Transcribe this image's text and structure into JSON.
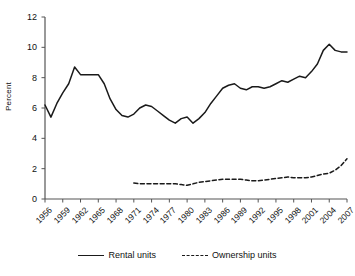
{
  "chart_data": {
    "type": "line",
    "title": "",
    "xlabel": "",
    "ylabel": "Percent",
    "ylim": [
      0,
      12
    ],
    "yticks": [
      0,
      2,
      4,
      6,
      8,
      10,
      12
    ],
    "xlim": [
      1956,
      2007
    ],
    "xticks": [
      1956,
      1959,
      1962,
      1965,
      1968,
      1971,
      1974,
      1977,
      1980,
      1983,
      1986,
      1989,
      1992,
      1995,
      1998,
      2001,
      2004,
      2007
    ],
    "xtick_labels": [
      "1956",
      "1959",
      "1962",
      "1965",
      "1968",
      "1971",
      "1974",
      "1977",
      "1980",
      "1983",
      "1986",
      "1989",
      "1992",
      "1995",
      "1998",
      "2001",
      "2004",
      "2007"
    ],
    "grid": false,
    "legend_position": "bottom-center",
    "line_color": "#1a1a1a",
    "x": [
      1956,
      1957,
      1958,
      1959,
      1960,
      1961,
      1962,
      1963,
      1964,
      1965,
      1966,
      1967,
      1968,
      1969,
      1970,
      1971,
      1972,
      1973,
      1974,
      1975,
      1976,
      1977,
      1978,
      1979,
      1980,
      1981,
      1982,
      1983,
      1984,
      1985,
      1986,
      1987,
      1988,
      1989,
      1990,
      1991,
      1992,
      1993,
      1994,
      1995,
      1996,
      1997,
      1998,
      1999,
      2000,
      2001,
      2002,
      2003,
      2004,
      2005,
      2006,
      2007
    ],
    "series": [
      {
        "name": "Rental units",
        "style": "solid",
        "x": [
          1956,
          1957,
          1958,
          1959,
          1960,
          1961,
          1962,
          1963,
          1964,
          1965,
          1966,
          1967,
          1968,
          1969,
          1970,
          1971,
          1972,
          1973,
          1974,
          1975,
          1976,
          1977,
          1978,
          1979,
          1980,
          1981,
          1982,
          1983,
          1984,
          1985,
          1986,
          1987,
          1988,
          1989,
          1990,
          1991,
          1992,
          1993,
          1994,
          1995,
          1996,
          1997,
          1998,
          1999,
          2000,
          2001,
          2002,
          2003,
          2004,
          2005,
          2006,
          2007
        ],
        "values": [
          6.2,
          5.4,
          6.3,
          7.0,
          7.6,
          8.7,
          8.2,
          8.2,
          8.2,
          8.2,
          7.6,
          6.6,
          5.9,
          5.5,
          5.4,
          5.6,
          6.0,
          6.2,
          6.1,
          5.8,
          5.5,
          5.2,
          5.0,
          5.3,
          5.4,
          5.0,
          5.3,
          5.7,
          6.3,
          6.8,
          7.3,
          7.5,
          7.6,
          7.3,
          7.2,
          7.4,
          7.4,
          7.3,
          7.4,
          7.6,
          7.8,
          7.7,
          7.9,
          8.1,
          8.0,
          8.4,
          8.9,
          9.8,
          10.2,
          9.8,
          9.7,
          9.7
        ]
      },
      {
        "name": "Ownership units",
        "style": "dashed",
        "x": [
          1971,
          1972,
          1973,
          1974,
          1975,
          1976,
          1977,
          1978,
          1979,
          1980,
          1981,
          1982,
          1983,
          1984,
          1985,
          1986,
          1987,
          1988,
          1989,
          1990,
          1991,
          1992,
          1993,
          1994,
          1995,
          1996,
          1997,
          1998,
          1999,
          2000,
          2001,
          2002,
          2003,
          2004,
          2005,
          2006,
          2007
        ],
        "values": [
          1.05,
          1.0,
          1.0,
          1.0,
          1.0,
          1.0,
          1.0,
          1.0,
          0.95,
          0.9,
          1.0,
          1.1,
          1.15,
          1.2,
          1.25,
          1.3,
          1.3,
          1.3,
          1.3,
          1.25,
          1.2,
          1.2,
          1.25,
          1.3,
          1.35,
          1.4,
          1.45,
          1.4,
          1.4,
          1.4,
          1.45,
          1.55,
          1.65,
          1.7,
          1.9,
          2.2,
          2.65
        ]
      }
    ]
  },
  "legend": {
    "entries": [
      {
        "label": "Rental units"
      },
      {
        "label": "Ownership units"
      }
    ]
  }
}
